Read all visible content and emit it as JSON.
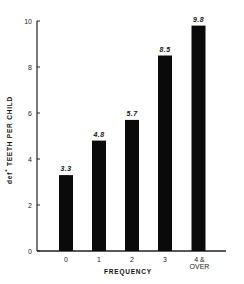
{
  "chart_data": {
    "type": "bar",
    "title": "",
    "xlabel": "FREQUENCY",
    "ylabel": "def* TEETH PER CHILD",
    "categories": [
      "0",
      "1",
      "2",
      "3",
      "4 & OVER"
    ],
    "category_lines": [
      [
        "0"
      ],
      [
        "1"
      ],
      [
        "2"
      ],
      [
        "3"
      ],
      [
        "4 &",
        "OVER"
      ]
    ],
    "values": [
      3.3,
      4.8,
      5.7,
      8.5,
      9.8
    ],
    "value_labels": [
      "3.3",
      "4.8",
      "5.7",
      "8.5",
      "9.8"
    ],
    "ylim": [
      0,
      10
    ],
    "yticks": [
      0,
      2,
      4,
      6,
      8,
      10
    ],
    "grid": false,
    "legend": null,
    "bar_color": "#0a0a0a",
    "axis_color": "#222222"
  }
}
